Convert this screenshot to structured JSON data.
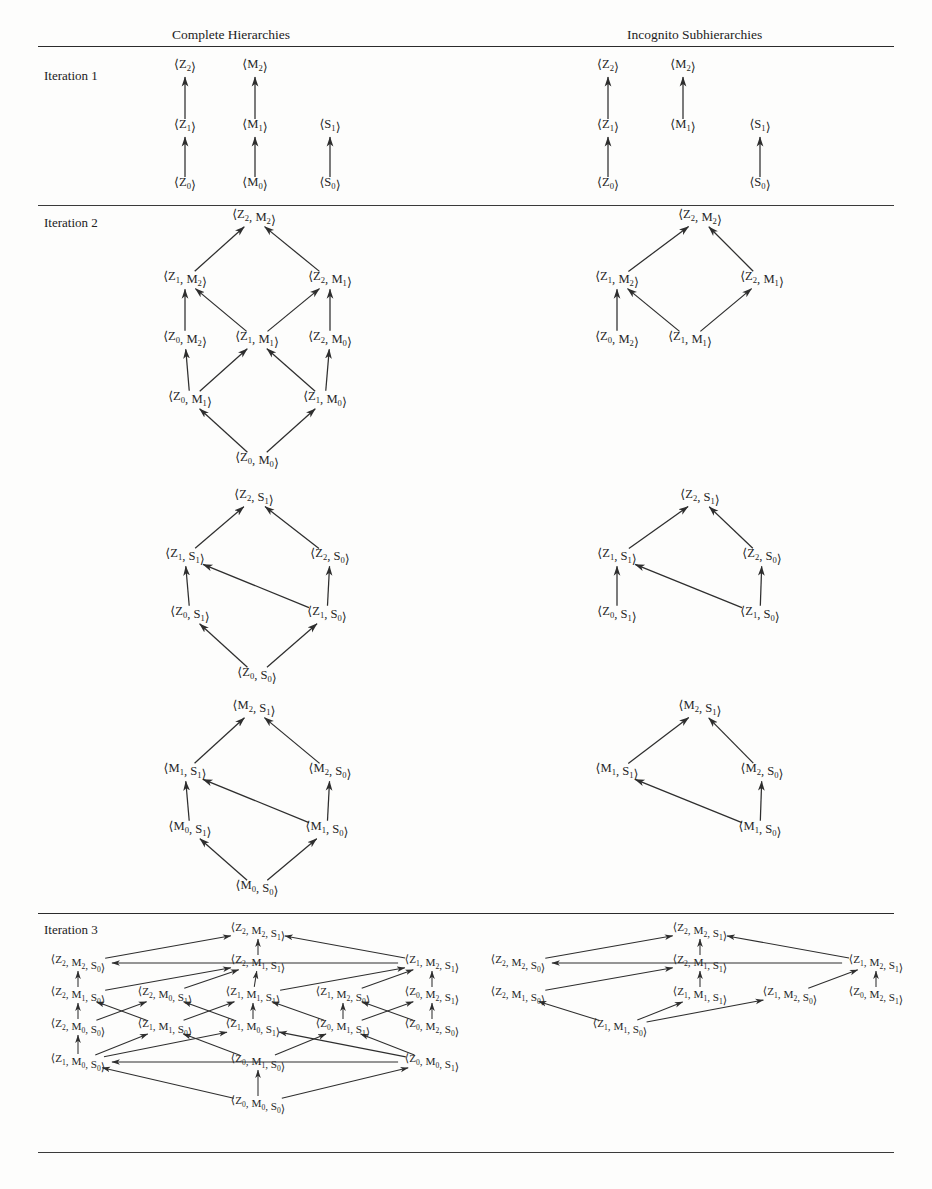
{
  "headers": {
    "left": "Complete Hierarchies",
    "right": "Incognito Subhierarchies"
  },
  "rows": [
    {
      "label": "Iteration 1"
    },
    {
      "label": "Iteration 2"
    },
    {
      "label": "Iteration 3"
    }
  ],
  "glyphs": {
    "open_angle": "⟨",
    "close_angle": "⟩",
    "comma": ","
  },
  "iteration1": {
    "complete": {
      "nodes": [
        {
          "id": "Z2",
          "base": "Z",
          "sub": "2",
          "x": 185,
          "y": 68
        },
        {
          "id": "M2",
          "base": "M",
          "sub": "2",
          "x": 255,
          "y": 68
        },
        {
          "id": "Z1",
          "base": "Z",
          "sub": "1",
          "x": 185,
          "y": 128
        },
        {
          "id": "M1",
          "base": "M",
          "sub": "1",
          "x": 255,
          "y": 128
        },
        {
          "id": "S1",
          "base": "S",
          "sub": "1",
          "x": 330,
          "y": 128
        },
        {
          "id": "Z0",
          "base": "Z",
          "sub": "0",
          "x": 185,
          "y": 186
        },
        {
          "id": "M0",
          "base": "M",
          "sub": "0",
          "x": 255,
          "y": 186
        },
        {
          "id": "S0",
          "base": "S",
          "sub": "0",
          "x": 330,
          "y": 186
        }
      ],
      "edges": [
        [
          "Z1",
          "Z2"
        ],
        [
          "M1",
          "M2"
        ],
        [
          "Z0",
          "Z1"
        ],
        [
          "M0",
          "M1"
        ],
        [
          "S0",
          "S1"
        ]
      ]
    },
    "incognito": {
      "nodes": [
        {
          "id": "Z2",
          "base": "Z",
          "sub": "2",
          "x": 608,
          "y": 68
        },
        {
          "id": "M2",
          "base": "M",
          "sub": "2",
          "x": 683,
          "y": 68
        },
        {
          "id": "Z1",
          "base": "Z",
          "sub": "1",
          "x": 608,
          "y": 128
        },
        {
          "id": "M1",
          "base": "M",
          "sub": "1",
          "x": 683,
          "y": 128
        },
        {
          "id": "S1",
          "base": "S",
          "sub": "1",
          "x": 760,
          "y": 128
        },
        {
          "id": "Z0",
          "base": "Z",
          "sub": "0",
          "x": 608,
          "y": 186
        },
        {
          "id": "S0",
          "base": "S",
          "sub": "0",
          "x": 760,
          "y": 186
        }
      ],
      "edges": [
        [
          "Z1",
          "Z2"
        ],
        [
          "M1",
          "M2"
        ],
        [
          "Z0",
          "Z1"
        ],
        [
          "S0",
          "S1"
        ]
      ]
    }
  },
  "iteration2": {
    "blockZM": {
      "complete": {
        "nodes": [
          {
            "id": "Z2M2",
            "pair": [
              "Z2",
              "M2"
            ],
            "x": 254,
            "y": 218
          },
          {
            "id": "Z1M2",
            "pair": [
              "Z1",
              "M2"
            ],
            "x": 185,
            "y": 280
          },
          {
            "id": "Z2M1",
            "pair": [
              "Z2",
              "M1"
            ],
            "x": 330,
            "y": 280
          },
          {
            "id": "Z0M2",
            "pair": [
              "Z0",
              "M2"
            ],
            "x": 185,
            "y": 340
          },
          {
            "id": "Z1M1",
            "pair": [
              "Z1",
              "M1"
            ],
            "x": 257,
            "y": 340
          },
          {
            "id": "Z2M0",
            "pair": [
              "Z2",
              "M0"
            ],
            "x": 330,
            "y": 340
          },
          {
            "id": "Z0M1",
            "pair": [
              "Z0",
              "M1"
            ],
            "x": 190,
            "y": 400
          },
          {
            "id": "Z1M0",
            "pair": [
              "Z1",
              "M0"
            ],
            "x": 325,
            "y": 400
          },
          {
            "id": "Z0M0",
            "pair": [
              "Z0",
              "M0"
            ],
            "x": 257,
            "y": 461
          }
        ],
        "edges": [
          [
            "Z1M2",
            "Z2M2"
          ],
          [
            "Z2M1",
            "Z2M2"
          ],
          [
            "Z0M2",
            "Z1M2"
          ],
          [
            "Z1M1",
            "Z1M2"
          ],
          [
            "Z1M1",
            "Z2M1"
          ],
          [
            "Z2M0",
            "Z2M1"
          ],
          [
            "Z0M1",
            "Z0M2"
          ],
          [
            "Z0M1",
            "Z1M1"
          ],
          [
            "Z1M0",
            "Z1M1"
          ],
          [
            "Z1M0",
            "Z2M0"
          ],
          [
            "Z0M0",
            "Z0M1"
          ],
          [
            "Z0M0",
            "Z1M0"
          ]
        ]
      },
      "incognito": {
        "nodes": [
          {
            "id": "Z2M2",
            "pair": [
              "Z2",
              "M2"
            ],
            "x": 700,
            "y": 218
          },
          {
            "id": "Z1M2",
            "pair": [
              "Z1",
              "M2"
            ],
            "x": 617,
            "y": 280
          },
          {
            "id": "Z2M1",
            "pair": [
              "Z2",
              "M1"
            ],
            "x": 762,
            "y": 280
          },
          {
            "id": "Z0M2",
            "pair": [
              "Z0",
              "M2"
            ],
            "x": 617,
            "y": 340
          },
          {
            "id": "Z1M1",
            "pair": [
              "Z1",
              "M1"
            ],
            "x": 690,
            "y": 340
          }
        ],
        "edges": [
          [
            "Z1M2",
            "Z2M2"
          ],
          [
            "Z2M1",
            "Z2M2"
          ],
          [
            "Z0M2",
            "Z1M2"
          ],
          [
            "Z1M1",
            "Z1M2"
          ],
          [
            "Z1M1",
            "Z2M1"
          ]
        ]
      }
    },
    "blockZS": {
      "complete": {
        "nodes": [
          {
            "id": "Z2S1",
            "pair": [
              "Z2",
              "S1"
            ],
            "x": 254,
            "y": 498
          },
          {
            "id": "Z1S1",
            "pair": [
              "Z1",
              "S1"
            ],
            "x": 185,
            "y": 557
          },
          {
            "id": "Z2S0",
            "pair": [
              "Z2",
              "S0"
            ],
            "x": 330,
            "y": 557
          },
          {
            "id": "Z0S1",
            "pair": [
              "Z0",
              "S1"
            ],
            "x": 190,
            "y": 615
          },
          {
            "id": "Z1S0",
            "pair": [
              "Z1",
              "S0"
            ],
            "x": 327,
            "y": 615
          },
          {
            "id": "Z0S0",
            "pair": [
              "Z0",
              "S0"
            ],
            "x": 257,
            "y": 676
          }
        ],
        "edges": [
          [
            "Z1S1",
            "Z2S1"
          ],
          [
            "Z2S0",
            "Z2S1"
          ],
          [
            "Z0S1",
            "Z1S1"
          ],
          [
            "Z1S0",
            "Z1S1"
          ],
          [
            "Z1S0",
            "Z2S0"
          ],
          [
            "Z0S0",
            "Z0S1"
          ],
          [
            "Z0S0",
            "Z1S0"
          ]
        ]
      },
      "incognito": {
        "nodes": [
          {
            "id": "Z2S1",
            "pair": [
              "Z2",
              "S1"
            ],
            "x": 700,
            "y": 498
          },
          {
            "id": "Z1S1",
            "pair": [
              "Z1",
              "S1"
            ],
            "x": 617,
            "y": 557
          },
          {
            "id": "Z2S0",
            "pair": [
              "Z2",
              "S0"
            ],
            "x": 762,
            "y": 557
          },
          {
            "id": "Z0S1",
            "pair": [
              "Z0",
              "S1"
            ],
            "x": 617,
            "y": 615
          },
          {
            "id": "Z1S0",
            "pair": [
              "Z1",
              "S0"
            ],
            "x": 760,
            "y": 615
          }
        ],
        "edges": [
          [
            "Z1S1",
            "Z2S1"
          ],
          [
            "Z2S0",
            "Z2S1"
          ],
          [
            "Z0S1",
            "Z1S1"
          ],
          [
            "Z1S0",
            "Z1S1"
          ],
          [
            "Z1S0",
            "Z2S0"
          ]
        ]
      }
    },
    "blockMS": {
      "complete": {
        "nodes": [
          {
            "id": "M2S1",
            "pair": [
              "M2",
              "S1"
            ],
            "x": 254,
            "y": 709
          },
          {
            "id": "M1S1",
            "pair": [
              "M1",
              "S1"
            ],
            "x": 185,
            "y": 772
          },
          {
            "id": "M2S0",
            "pair": [
              "M2",
              "S0"
            ],
            "x": 330,
            "y": 772
          },
          {
            "id": "M0S1",
            "pair": [
              "M0",
              "S1"
            ],
            "x": 190,
            "y": 830
          },
          {
            "id": "M1S0",
            "pair": [
              "M1",
              "S0"
            ],
            "x": 327,
            "y": 830
          },
          {
            "id": "M0S0",
            "pair": [
              "M0",
              "S0"
            ],
            "x": 257,
            "y": 889
          }
        ],
        "edges": [
          [
            "M1S1",
            "M2S1"
          ],
          [
            "M2S0",
            "M2S1"
          ],
          [
            "M0S1",
            "M1S1"
          ],
          [
            "M1S0",
            "M1S1"
          ],
          [
            "M1S0",
            "M2S0"
          ],
          [
            "M0S0",
            "M0S1"
          ],
          [
            "M0S0",
            "M1S0"
          ]
        ]
      },
      "incognito": {
        "nodes": [
          {
            "id": "M2S1",
            "pair": [
              "M2",
              "S1"
            ],
            "x": 700,
            "y": 709
          },
          {
            "id": "M1S1",
            "pair": [
              "M1",
              "S1"
            ],
            "x": 617,
            "y": 772
          },
          {
            "id": "M2S0",
            "pair": [
              "M2",
              "S0"
            ],
            "x": 762,
            "y": 772
          },
          {
            "id": "M1S0",
            "pair": [
              "M1",
              "S0"
            ],
            "x": 760,
            "y": 830
          }
        ],
        "edges": [
          [
            "M1S1",
            "M2S1"
          ],
          [
            "M2S0",
            "M2S1"
          ],
          [
            "M1S0",
            "M1S1"
          ],
          [
            "M1S0",
            "M2S0"
          ]
        ]
      }
    }
  },
  "iteration3": {
    "complete": {
      "nodes": [
        {
          "id": "Z2M2S1",
          "triple": [
            "Z2",
            "M2",
            "S1"
          ],
          "x": 258,
          "y": 931
        },
        {
          "id": "Z2M2S0",
          "triple": [
            "Z2",
            "M2",
            "S0"
          ],
          "x": 78,
          "y": 963
        },
        {
          "id": "Z2M1S1",
          "triple": [
            "Z2",
            "M1",
            "S1"
          ],
          "x": 258,
          "y": 963
        },
        {
          "id": "Z1M2S1",
          "triple": [
            "Z1",
            "M2",
            "S1"
          ],
          "x": 432,
          "y": 963
        },
        {
          "id": "Z2M1S0",
          "triple": [
            "Z2",
            "M1",
            "S0"
          ],
          "x": 78,
          "y": 995
        },
        {
          "id": "Z2M0S1",
          "triple": [
            "Z2",
            "M0",
            "S1"
          ],
          "x": 165,
          "y": 995
        },
        {
          "id": "Z1M1S1",
          "triple": [
            "Z1",
            "M1",
            "S1"
          ],
          "x": 253,
          "y": 995
        },
        {
          "id": "Z1M2S0",
          "triple": [
            "Z1",
            "M2",
            "S0"
          ],
          "x": 343,
          "y": 995
        },
        {
          "id": "Z0M2S1",
          "triple": [
            "Z0",
            "M2",
            "S1"
          ],
          "x": 432,
          "y": 995
        },
        {
          "id": "Z2M0S0",
          "triple": [
            "Z2",
            "M0",
            "S0"
          ],
          "x": 78,
          "y": 1027
        },
        {
          "id": "Z1M1S0",
          "triple": [
            "Z1",
            "M1",
            "S0"
          ],
          "x": 165,
          "y": 1027
        },
        {
          "id": "Z1M0S1",
          "triple": [
            "Z1",
            "M0",
            "S1"
          ],
          "x": 253,
          "y": 1027
        },
        {
          "id": "Z0M1S1",
          "triple": [
            "Z0",
            "M1",
            "S1"
          ],
          "x": 343,
          "y": 1027
        },
        {
          "id": "Z0M2S0",
          "triple": [
            "Z0",
            "M2",
            "S0"
          ],
          "x": 432,
          "y": 1027
        },
        {
          "id": "Z1M0S0",
          "triple": [
            "Z1",
            "M0",
            "S0"
          ],
          "x": 78,
          "y": 1062
        },
        {
          "id": "Z0M1S0",
          "triple": [
            "Z0",
            "M1",
            "S0"
          ],
          "x": 258,
          "y": 1062
        },
        {
          "id": "Z0M0S1",
          "triple": [
            "Z0",
            "M0",
            "S1"
          ],
          "x": 432,
          "y": 1062
        },
        {
          "id": "Z0M0S0",
          "triple": [
            "Z0",
            "M0",
            "S0"
          ],
          "x": 258,
          "y": 1104
        }
      ],
      "edges": [
        [
          "Z2M2S0",
          "Z2M2S1"
        ],
        [
          "Z2M1S1",
          "Z2M2S1"
        ],
        [
          "Z1M2S1",
          "Z2M2S1"
        ],
        [
          "Z2M1S0",
          "Z2M2S0"
        ],
        [
          "Z1M2S1",
          "Z2M2S0"
        ],
        [
          "Z2M0S1",
          "Z2M1S1"
        ],
        [
          "Z1M1S1",
          "Z2M1S1"
        ],
        [
          "Z2M1S0",
          "Z2M1S1"
        ],
        [
          "Z1M1S1",
          "Z1M2S1"
        ],
        [
          "Z1M2S0",
          "Z1M2S1"
        ],
        [
          "Z0M2S1",
          "Z1M2S1"
        ],
        [
          "Z2M0S0",
          "Z2M1S0"
        ],
        [
          "Z1M1S0",
          "Z2M1S0"
        ],
        [
          "Z2M0S0",
          "Z2M0S1"
        ],
        [
          "Z1M0S1",
          "Z2M0S1"
        ],
        [
          "Z1M1S0",
          "Z1M1S1"
        ],
        [
          "Z1M0S1",
          "Z1M1S1"
        ],
        [
          "Z0M1S1",
          "Z1M1S1"
        ],
        [
          "Z0M1S1",
          "Z1M2S0"
        ],
        [
          "Z0M2S0",
          "Z1M2S0"
        ],
        [
          "Z0M2S0",
          "Z0M2S1"
        ],
        [
          "Z0M1S1",
          "Z0M2S1"
        ],
        [
          "Z1M0S0",
          "Z2M0S0"
        ],
        [
          "Z1M0S0",
          "Z1M1S0"
        ],
        [
          "Z0M1S0",
          "Z1M1S0"
        ],
        [
          "Z1M0S0",
          "Z1M0S1"
        ],
        [
          "Z0M0S1",
          "Z1M0S1"
        ],
        [
          "Z0M1S0",
          "Z0M1S1"
        ],
        [
          "Z0M0S1",
          "Z0M1S1"
        ],
        [
          "Z0M0S1",
          "Z1M0S0"
        ],
        [
          "Z0M0S0",
          "Z0M1S0"
        ],
        [
          "Z0M0S0",
          "Z1M0S0"
        ],
        [
          "Z0M0S0",
          "Z0M0S1"
        ]
      ]
    },
    "incognito": {
      "nodes": [
        {
          "id": "Z2M2S1",
          "triple": [
            "Z2",
            "M2",
            "S1"
          ],
          "x": 700,
          "y": 931
        },
        {
          "id": "Z2M2S0",
          "triple": [
            "Z2",
            "M2",
            "S0"
          ],
          "x": 518,
          "y": 963
        },
        {
          "id": "Z2M1S1",
          "triple": [
            "Z2",
            "M1",
            "S1"
          ],
          "x": 700,
          "y": 963
        },
        {
          "id": "Z1M2S1",
          "triple": [
            "Z1",
            "M2",
            "S1"
          ],
          "x": 876,
          "y": 963
        },
        {
          "id": "Z2M1S0",
          "triple": [
            "Z2",
            "M1",
            "S0"
          ],
          "x": 518,
          "y": 995
        },
        {
          "id": "Z1M1S1",
          "triple": [
            "Z1",
            "M1",
            "S1"
          ],
          "x": 700,
          "y": 995
        },
        {
          "id": "Z1M2S0",
          "triple": [
            "Z1",
            "M2",
            "S0"
          ],
          "x": 790,
          "y": 995
        },
        {
          "id": "Z0M2S1",
          "triple": [
            "Z0",
            "M2",
            "S1"
          ],
          "x": 876,
          "y": 995
        },
        {
          "id": "Z1M1S0",
          "triple": [
            "Z1",
            "M1",
            "S0"
          ],
          "x": 620,
          "y": 1027
        }
      ],
      "edges": [
        [
          "Z2M2S0",
          "Z2M2S1"
        ],
        [
          "Z2M1S1",
          "Z2M2S1"
        ],
        [
          "Z1M2S1",
          "Z2M2S1"
        ],
        [
          "Z1M2S1",
          "Z2M2S0"
        ],
        [
          "Z2M1S0",
          "Z2M1S1"
        ],
        [
          "Z1M1S1",
          "Z2M1S1"
        ],
        [
          "Z1M2S0",
          "Z1M2S1"
        ],
        [
          "Z0M2S1",
          "Z1M2S1"
        ],
        [
          "Z1M1S0",
          "Z2M1S0"
        ],
        [
          "Z1M1S0",
          "Z1M1S1"
        ],
        [
          "Z1M1S0",
          "Z1M2S0"
        ]
      ]
    }
  },
  "rules": [
    {
      "y": 46
    },
    {
      "y": 205
    },
    {
      "y": 913
    },
    {
      "y": 1152
    }
  ],
  "layout": {
    "header_left_x": 172,
    "header_left_y": 27,
    "header_right_x": 627,
    "header_right_y": 27,
    "row_label_x": 44,
    "row_label_ys": [
      68,
      215,
      922
    ]
  }
}
